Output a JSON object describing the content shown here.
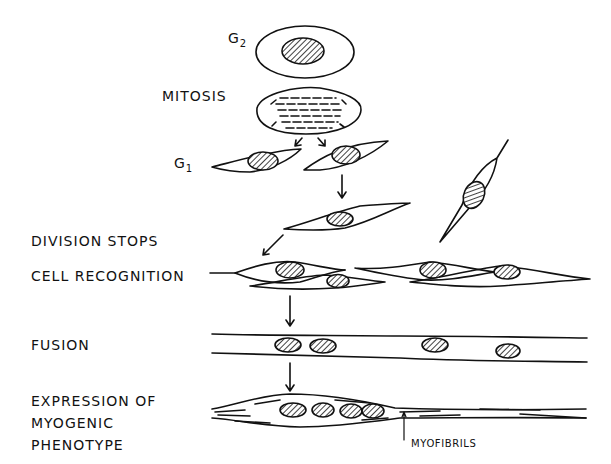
{
  "diagram": {
    "stages": [
      {
        "id": "g2",
        "label": "G",
        "subscript": "2"
      },
      {
        "id": "mitosis",
        "label": "MITOSIS"
      },
      {
        "id": "g1",
        "label": "G",
        "subscript": "1"
      },
      {
        "id": "division_stops",
        "label": "DIVISION STOPS"
      },
      {
        "id": "cell_recognition",
        "label": "CELL RECOGNITION"
      },
      {
        "id": "fusion",
        "label": "FUSION"
      },
      {
        "id": "expression",
        "label_lines": [
          "EXPRESSION OF",
          "MYOGENIC",
          "PHENOTYPE"
        ]
      }
    ],
    "annotations": {
      "myofibrils": "MYOFIBRILS"
    },
    "colors": {
      "ink": "#111111",
      "background": "#ffffff"
    }
  }
}
